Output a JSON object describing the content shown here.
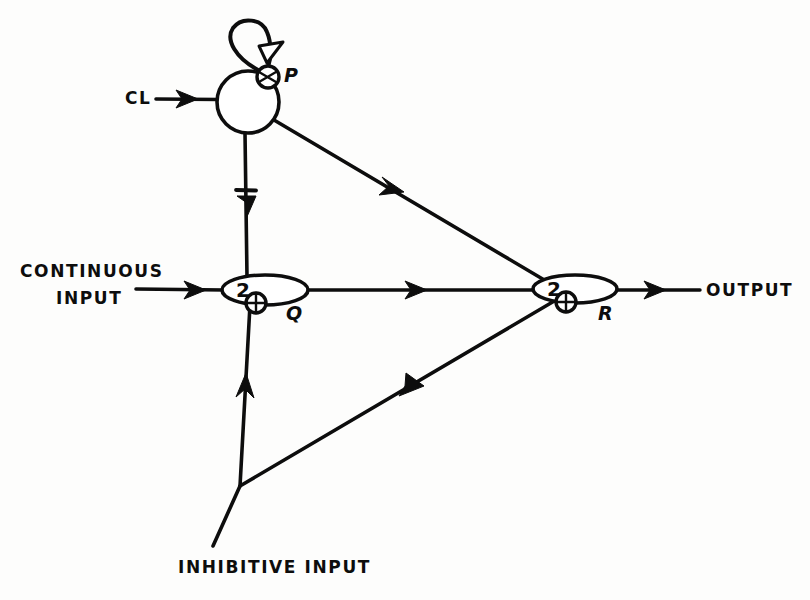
{
  "figure": {
    "background_color": "#fdfdfc",
    "ink_color": "#0d0d0d"
  },
  "nodes": [
    {
      "id": "P",
      "label": "P",
      "shape": "circle",
      "weight": "",
      "cx": 248,
      "cy": 102,
      "r": 31,
      "label_x": 284,
      "label_y": 82,
      "endbulb": {
        "cx": 268,
        "cy": 77,
        "r": 11
      }
    },
    {
      "id": "Q",
      "label": "Q",
      "shape": "ellipse",
      "weight": "2",
      "cx": 265,
      "cy": 290,
      "rx": 43,
      "ry": 15,
      "label_x": 286,
      "label_y": 320,
      "weight_x": 243,
      "weight_y": 297,
      "endbulb": {
        "cx": 256,
        "cy": 303,
        "r": 10
      }
    },
    {
      "id": "R",
      "label": "R",
      "shape": "ellipse",
      "weight": "2",
      "cx": 575,
      "cy": 289,
      "rx": 42,
      "ry": 14,
      "label_x": 598,
      "label_y": 320,
      "weight_x": 554,
      "weight_y": 296,
      "endbulb": {
        "cx": 566,
        "cy": 302,
        "r": 10
      }
    }
  ],
  "io_labels": [
    {
      "name": "clock-input-label",
      "lines": [
        "CL"
      ],
      "x": 125,
      "y": 104,
      "anchor": "start"
    },
    {
      "name": "continuous-input-label",
      "lines": [
        "CONTINUOUS",
        "INPUT"
      ],
      "x": 20,
      "y": 277,
      "anchor": "start"
    },
    {
      "name": "inhibitive-input-label",
      "lines": [
        "INHIBITIVE INPUT"
      ],
      "x": 178,
      "y": 573,
      "anchor": "start"
    },
    {
      "name": "output-label",
      "lines": [
        "OUTPUT"
      ],
      "x": 706,
      "y": 296,
      "anchor": "start"
    }
  ],
  "connections": [
    {
      "name": "clock-input-to-p",
      "from": "CL",
      "to": "P",
      "kind": "excitatory",
      "arrow": "solid"
    },
    {
      "name": "p-self-loop",
      "from": "P",
      "to": "P",
      "kind": "feedback-self-loop",
      "arrow": "open-triangle"
    },
    {
      "name": "p-to-q",
      "from": "P",
      "to": "Q",
      "kind": "inhibitory",
      "arrow": "solid"
    },
    {
      "name": "p-to-r",
      "from": "P",
      "to": "R",
      "kind": "excitatory",
      "arrow": "solid"
    },
    {
      "name": "continuous-input-to-q",
      "from": "CONTINUOUS INPUT",
      "to": "Q",
      "kind": "excitatory",
      "arrow": "solid"
    },
    {
      "name": "q-to-r",
      "from": "Q",
      "to": "R",
      "kind": "excitatory",
      "arrow": "solid"
    },
    {
      "name": "inhibitive-input-to-q",
      "from": "INHIBITIVE INPUT",
      "to": "Q",
      "kind": "inhibitory",
      "arrow": "solid"
    },
    {
      "name": "inhibitive-input-to-r",
      "from": "INHIBITIVE INPUT",
      "to": "R",
      "kind": "inhibitory",
      "arrow": "solid"
    }
  ]
}
